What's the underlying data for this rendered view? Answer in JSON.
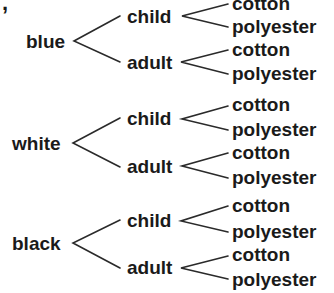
{
  "diagram": {
    "type": "tree",
    "stray_mark": ",",
    "groups": [
      {
        "label": "blue",
        "branches": [
          {
            "label": "child",
            "leaves": [
              "cotton",
              "polyester"
            ]
          },
          {
            "label": "adult",
            "leaves": [
              "cotton",
              "polyester"
            ]
          }
        ]
      },
      {
        "label": "white",
        "branches": [
          {
            "label": "child",
            "leaves": [
              "cotton",
              "polyester"
            ]
          },
          {
            "label": "adult",
            "leaves": [
              "cotton",
              "polyester"
            ]
          }
        ]
      },
      {
        "label": "black",
        "branches": [
          {
            "label": "child",
            "leaves": [
              "cotton",
              "polyester"
            ]
          },
          {
            "label": "adult",
            "leaves": [
              "cotton",
              "polyester"
            ]
          }
        ]
      }
    ],
    "line_color": "#2a2a2a"
  }
}
